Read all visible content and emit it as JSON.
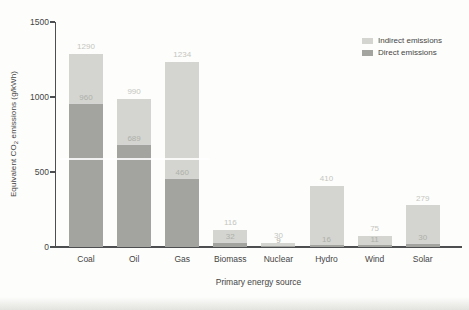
{
  "colors": {
    "indirect": "#d4d5d0",
    "direct": "#a3a49f",
    "total_label": "#c4c6c0",
    "direct_label": "#aeb0aa",
    "axis": "#4d4e50",
    "text": "#454545",
    "background": "#fdfdfb"
  },
  "legend": {
    "items": [
      {
        "label": "Indirect emissions",
        "key": "indirect"
      },
      {
        "label": "Direct emissions",
        "key": "direct"
      }
    ]
  },
  "axes": {
    "ylabel_prefix": "Equivalent CO",
    "ylabel_sub": "2",
    "ylabel_suffix": " emissions (g/kWh)",
    "xlabel": "Primary energy source"
  },
  "chart_data": {
    "type": "bar",
    "stacked": true,
    "categories": [
      "Coal",
      "Oil",
      "Gas",
      "Biomass",
      "Nuclear",
      "Hydro",
      "Wind",
      "Solar"
    ],
    "series": [
      {
        "name": "Direct emissions",
        "values": [
          960,
          689,
          460,
          32,
          9,
          16,
          11,
          30
        ]
      },
      {
        "name": "Indirect emissions",
        "values": [
          330,
          301,
          774,
          84,
          21,
          394,
          64,
          249
        ]
      }
    ],
    "totals": [
      1290,
      990,
      1234,
      116,
      30,
      410,
      75,
      279
    ],
    "bar_value_labels": {
      "total": [
        1290,
        990,
        1234,
        116,
        30,
        410,
        75,
        279
      ],
      "direct": [
        960,
        689,
        460,
        32,
        9,
        16,
        11,
        30
      ]
    },
    "title": "",
    "xlabel": "Primary energy source",
    "ylabel": "Equivalent CO2 emissions (g/kWh)",
    "ylim": [
      0,
      1500
    ],
    "yticks": [
      0,
      500,
      1000,
      1500
    ],
    "grid": false,
    "legend_position": "top-right"
  }
}
